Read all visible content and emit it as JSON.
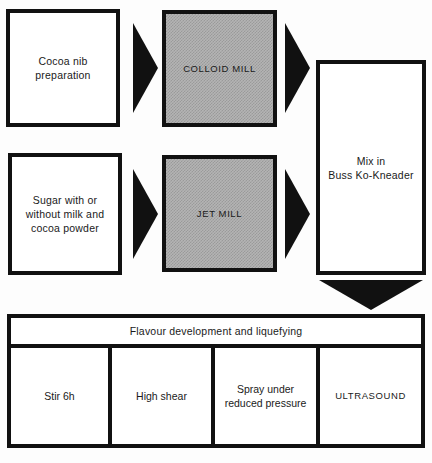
{
  "diagram": {
    "colors": {
      "stroke": "#111111",
      "background": "#ffffff",
      "shaded_fill": "#b4b4b4"
    },
    "nodes": {
      "cocoa_nib": {
        "label": "Cocoa nib\npreparation",
        "line1": "Cocoa nib",
        "line2": "preparation",
        "shaded": false
      },
      "colloid_mill": {
        "label": "COLLOID MILL",
        "shaded": true
      },
      "sugar": {
        "label": "Sugar with or\nwithout milk and\ncocoa powder",
        "line1": "Sugar with or",
        "line2": "without milk and",
        "line3": "cocoa powder",
        "shaded": false
      },
      "jet_mill": {
        "label": "JET MILL",
        "shaded": true
      },
      "mix": {
        "label": "Mix in\nBuss Ko-Kneader",
        "line1": "Mix in",
        "line2": "Buss Ko-Kneader",
        "shaded": false
      },
      "flavour": {
        "label": "Flavour development and liquefying"
      }
    },
    "flavour_steps": [
      {
        "label": "Stir 6h",
        "shaded": false
      },
      {
        "label": "High shear",
        "shaded": false
      },
      {
        "label": "Spray under\nreduced pressure",
        "line1": "Spray under",
        "line2": "reduced pressure",
        "shaded": false
      },
      {
        "label": "ULTRASOUND",
        "shaded": true
      }
    ],
    "arrows": [
      {
        "name": "cocoa-nib-to-colloid-mill",
        "direction": "right"
      },
      {
        "name": "colloid-mill-to-mix",
        "direction": "right"
      },
      {
        "name": "sugar-to-jet-mill",
        "direction": "right"
      },
      {
        "name": "jet-mill-to-mix",
        "direction": "right"
      },
      {
        "name": "mix-to-flavour",
        "direction": "down"
      }
    ]
  }
}
